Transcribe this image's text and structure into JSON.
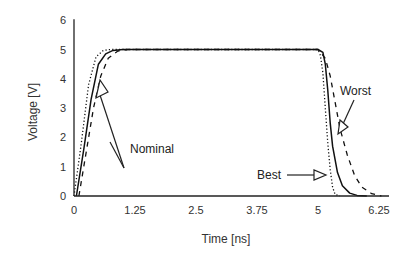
{
  "chart_data": {
    "type": "line",
    "title": "",
    "xlabel": "Time  [ns]",
    "ylabel": "Voltage  [V]",
    "xlim": [
      0,
      6.5
    ],
    "ylim": [
      0,
      6
    ],
    "x_ticks": [
      "0",
      "1.25",
      "2.5",
      "3.75",
      "5",
      "6.25"
    ],
    "y_ticks": [
      "0",
      "1",
      "2",
      "3",
      "4",
      "5",
      "6"
    ],
    "grid": false,
    "legend": "none (inline annotations)",
    "series": [
      {
        "name": "Nominal",
        "style": "solid",
        "x": [
          0.05,
          0.2,
          0.35,
          0.5,
          0.65,
          0.8,
          1.0,
          1.25,
          2.5,
          3.75,
          5.0,
          5.1,
          5.15,
          5.2,
          5.25,
          5.3,
          5.4,
          5.5,
          5.65,
          5.8,
          6.0
        ],
        "y": [
          0,
          1.6,
          3.3,
          4.5,
          4.85,
          4.97,
          5.0,
          5.0,
          5.0,
          5.0,
          5.0,
          4.9,
          4.5,
          3.6,
          2.5,
          1.7,
          0.8,
          0.35,
          0.1,
          0.02,
          0
        ]
      },
      {
        "name": "Best",
        "style": "dotted",
        "x": [
          0.0,
          0.15,
          0.3,
          0.45,
          0.6,
          0.75,
          1.0,
          1.25,
          2.5,
          3.75,
          5.0,
          5.05,
          5.1,
          5.15,
          5.2,
          5.25,
          5.3,
          5.35,
          5.45
        ],
        "y": [
          0,
          1.8,
          3.8,
          4.75,
          4.97,
          5.0,
          5.0,
          5.0,
          5.0,
          5.0,
          5.0,
          4.8,
          4.2,
          3.0,
          1.8,
          0.9,
          0.3,
          0.05,
          0
        ]
      },
      {
        "name": "Worst",
        "style": "dashed",
        "x": [
          0.1,
          0.25,
          0.4,
          0.55,
          0.7,
          0.9,
          1.1,
          1.25,
          2.5,
          3.75,
          5.0,
          5.15,
          5.25,
          5.35,
          5.45,
          5.6,
          5.75,
          5.9,
          6.1,
          6.3
        ],
        "y": [
          0,
          1.5,
          3.0,
          4.1,
          4.7,
          4.95,
          5.0,
          5.0,
          5.0,
          5.0,
          5.0,
          4.7,
          4.1,
          3.2,
          2.3,
          1.4,
          0.7,
          0.3,
          0.08,
          0
        ]
      }
    ],
    "annotations": [
      {
        "text": "Nominal",
        "points_to": "rising edge near (0.55 ns, 4.6 V)"
      },
      {
        "text": "Best",
        "points_to": "falling edge near (5.2 ns, 0.8 V)"
      },
      {
        "text": "Worst",
        "points_to": "falling edge near (5.55 ns, 2.4 V)"
      }
    ]
  },
  "labels": {
    "xlabel": "Time  [ns]",
    "ylabel": "Voltage  [V]",
    "annot_nominal": "Nominal",
    "annot_best": "Best",
    "annot_worst": "Worst"
  }
}
